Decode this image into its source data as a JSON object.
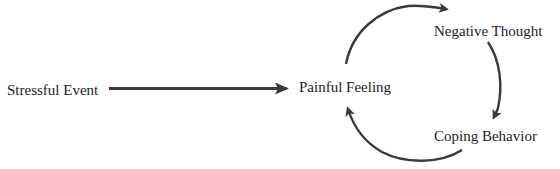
{
  "diagram": {
    "type": "flow-cycle",
    "colors": {
      "text": "#1c1c1c",
      "arrow": "#3a3a3a",
      "background": "#ffffff"
    },
    "nodes": [
      {
        "id": "stressful_event",
        "label": "Stressful Event"
      },
      {
        "id": "painful_feeling",
        "label": "Painful Feeling"
      },
      {
        "id": "negative_thought",
        "label": "Negative Thought"
      },
      {
        "id": "coping_behavior",
        "label": "Coping Behavior"
      }
    ],
    "edges": [
      {
        "from": "stressful_event",
        "to": "painful_feeling",
        "style": "straight"
      },
      {
        "from": "painful_feeling",
        "to": "negative_thought",
        "style": "curved"
      },
      {
        "from": "negative_thought",
        "to": "coping_behavior",
        "style": "curved"
      },
      {
        "from": "coping_behavior",
        "to": "painful_feeling",
        "style": "curved"
      }
    ]
  }
}
